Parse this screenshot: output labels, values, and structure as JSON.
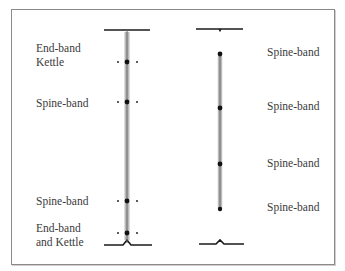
{
  "diagram": {
    "type": "sewing-structure",
    "left_spine": {
      "labels": [
        {
          "text": "End-band\nKettle",
          "x": 36,
          "y": 42
        },
        {
          "text": "Spine-band",
          "x": 36,
          "y": 97
        },
        {
          "text": "Spine-band",
          "x": 36,
          "y": 196
        },
        {
          "text": "End-band\nand Kettle",
          "x": 36,
          "y": 223
        }
      ],
      "stations_y": [
        62,
        102,
        201,
        233
      ]
    },
    "right_spine": {
      "labels": [
        {
          "text": "Spine-band",
          "x": 267,
          "y": 46
        },
        {
          "text": "Spine-band",
          "x": 267,
          "y": 100
        },
        {
          "text": "Spine-band",
          "x": 267,
          "y": 157
        },
        {
          "text": "Spine-band",
          "x": 267,
          "y": 201
        }
      ],
      "stations_y": [
        54,
        108,
        164,
        209
      ]
    },
    "colors": {
      "line": "#1a1a1a",
      "stitch": "#555555",
      "text": "#3a3a3a",
      "border": "#8a8a8a"
    }
  }
}
